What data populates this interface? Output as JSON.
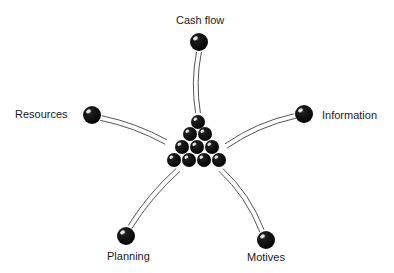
{
  "diagram": {
    "type": "hub-and-spoke",
    "hub": {
      "name": "ball-cluster",
      "description": "triangular pyramid of 10 black balls",
      "balls": [
        {
          "x": 198,
          "y": 122
        },
        {
          "x": 190,
          "y": 134
        },
        {
          "x": 205,
          "y": 134
        },
        {
          "x": 182,
          "y": 147
        },
        {
          "x": 197,
          "y": 147
        },
        {
          "x": 212,
          "y": 147
        },
        {
          "x": 174,
          "y": 160
        },
        {
          "x": 189,
          "y": 160
        },
        {
          "x": 204,
          "y": 160
        },
        {
          "x": 219,
          "y": 160
        }
      ],
      "ball_radius": 7
    },
    "spokes": [
      {
        "id": "cash-flow",
        "label": "Cash flow",
        "ball": {
          "x": 199,
          "y": 42,
          "r": 9
        },
        "stick_from": {
          "x": 199,
          "y": 52
        },
        "stick_to": {
          "x": 198,
          "y": 113
        },
        "curve": {
          "x": 193,
          "y": 82
        },
        "label_pos": {
          "x": 176,
          "y": 14
        }
      },
      {
        "id": "resources",
        "label": "Resources",
        "ball": {
          "x": 92,
          "y": 115,
          "r": 9
        },
        "stick_from": {
          "x": 101,
          "y": 118
        },
        "stick_to": {
          "x": 166,
          "y": 142
        },
        "curve": {
          "x": 135,
          "y": 125
        },
        "label_pos": {
          "x": 15,
          "y": 108
        }
      },
      {
        "id": "information",
        "label": "Information",
        "ball": {
          "x": 304,
          "y": 114,
          "r": 9
        },
        "stick_from": {
          "x": 295,
          "y": 116
        },
        "stick_to": {
          "x": 226,
          "y": 146
        },
        "curve": {
          "x": 258,
          "y": 124
        },
        "label_pos": {
          "x": 322,
          "y": 109
        }
      },
      {
        "id": "planning",
        "label": "Planning",
        "ball": {
          "x": 126,
          "y": 236,
          "r": 9
        },
        "stick_from": {
          "x": 130,
          "y": 227
        },
        "stick_to": {
          "x": 178,
          "y": 170
        },
        "curve": {
          "x": 150,
          "y": 195
        },
        "label_pos": {
          "x": 107,
          "y": 250
        }
      },
      {
        "id": "motives",
        "label": "Motives",
        "ball": {
          "x": 266,
          "y": 240,
          "r": 9
        },
        "stick_from": {
          "x": 262,
          "y": 231
        },
        "stick_to": {
          "x": 221,
          "y": 170
        },
        "curve": {
          "x": 248,
          "y": 195
        },
        "label_pos": {
          "x": 247,
          "y": 251
        }
      }
    ],
    "colors": {
      "ball": "#111111",
      "highlight": "#ffffff",
      "stick": "#555555",
      "background": "#ffffff",
      "text": "#1a1a1a"
    }
  }
}
